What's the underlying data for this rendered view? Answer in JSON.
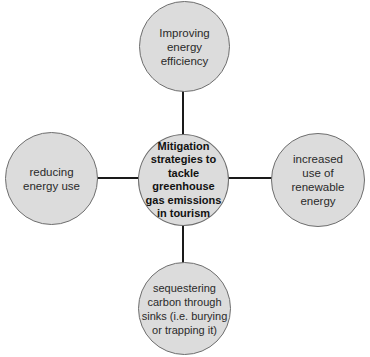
{
  "diagram": {
    "type": "hub-and-spoke concept map",
    "center": {
      "label": "Mitigation strategies to tackle greenhouse gas emissions in tourism"
    },
    "nodes": [
      {
        "position": "top",
        "label": "Improving energy efficiency"
      },
      {
        "position": "left",
        "label": "reducing energy use"
      },
      {
        "position": "right",
        "label": "increased use of renewable energy"
      },
      {
        "position": "bottom",
        "label": "sequestering carbon through sinks (i.e. burying or trapping it)"
      }
    ],
    "colors": {
      "node_fill": "#dcdcdc",
      "node_border": "#6e6e6e",
      "connector": "#1a1a1a",
      "background": "#ffffff"
    }
  }
}
